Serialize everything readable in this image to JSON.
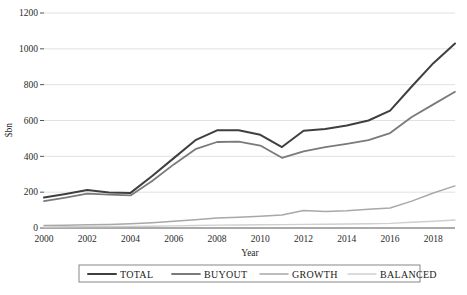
{
  "chart_data": {
    "type": "line",
    "title": "",
    "xlabel": "Year",
    "ylabel": "$bn",
    "xlim": [
      2000,
      2019
    ],
    "ylim": [
      0,
      1200
    ],
    "ytick_labels": [
      "0",
      "200",
      "400",
      "600",
      "800",
      "1000",
      "1200"
    ],
    "ytick_values": [
      0,
      200,
      400,
      600,
      800,
      1000,
      1200
    ],
    "xtick_labels": [
      "2000",
      "2002",
      "2004",
      "2006",
      "2008",
      "2010",
      "2012",
      "2014",
      "2016",
      "2018"
    ],
    "xtick_values": [
      2000,
      2002,
      2004,
      2006,
      2008,
      2010,
      2012,
      2014,
      2016,
      2018
    ],
    "grid": true,
    "legend_position": "bottom",
    "x": [
      2000,
      2001,
      2002,
      2003,
      2004,
      2005,
      2006,
      2007,
      2008,
      2009,
      2010,
      2011,
      2012,
      2013,
      2014,
      2015,
      2016,
      2017,
      2018,
      2019
    ],
    "series": [
      {
        "name": "TOTAL",
        "color": "#3f3f3f",
        "width": 2.0,
        "values": [
          170,
          190,
          212,
          198,
          196,
          290,
          390,
          490,
          545,
          545,
          520,
          452,
          543,
          552,
          572,
          600,
          655,
          790,
          920,
          1030
        ]
      },
      {
        "name": "BUYOUT",
        "color": "#7a7a7a",
        "width": 1.8,
        "values": [
          150,
          170,
          192,
          186,
          182,
          262,
          355,
          440,
          480,
          482,
          460,
          392,
          428,
          452,
          470,
          490,
          530,
          620,
          690,
          760
        ]
      },
      {
        "name": "GROWTH",
        "color": "#a8a8a8",
        "width": 1.5,
        "values": [
          14,
          16,
          18,
          20,
          24,
          30,
          38,
          46,
          56,
          60,
          66,
          72,
          98,
          92,
          96,
          104,
          112,
          150,
          195,
          235
        ]
      },
      {
        "name": "BALANCED",
        "color": "#cfcfcf",
        "width": 1.4,
        "values": [
          6,
          7,
          8,
          8,
          9,
          10,
          12,
          14,
          16,
          17,
          18,
          19,
          20,
          21,
          22,
          24,
          26,
          32,
          38,
          45
        ]
      }
    ]
  },
  "legend": {
    "items": [
      {
        "label": "TOTAL"
      },
      {
        "label": "BUYOUT"
      },
      {
        "label": "GROWTH"
      },
      {
        "label": "BALANCED"
      }
    ]
  },
  "axes": {
    "y_title": "$bn",
    "x_title": "Year"
  }
}
